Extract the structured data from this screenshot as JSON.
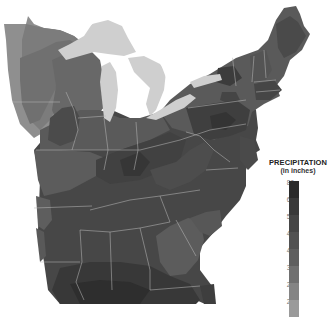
{
  "legend": {
    "title": "PRECIPITATION",
    "subtitle": "(in inches)",
    "stops": [
      {
        "label": "80",
        "color": "#2b2b2b"
      },
      {
        "label": "64",
        "color": "#3a3a3a"
      },
      {
        "label": "56",
        "color": "#464646"
      },
      {
        "label": "48",
        "color": "#525252"
      },
      {
        "label": "40",
        "color": "#5f5f5f"
      },
      {
        "label": "32",
        "color": "#707070"
      },
      {
        "label": "28",
        "color": "#848484"
      },
      {
        "label": "24",
        "color": "#9a9a9a"
      }
    ]
  },
  "colors": {
    "lakes": "#cfcfcf",
    "state_borders": "#b8b8b8",
    "background": "#ffffff"
  }
}
